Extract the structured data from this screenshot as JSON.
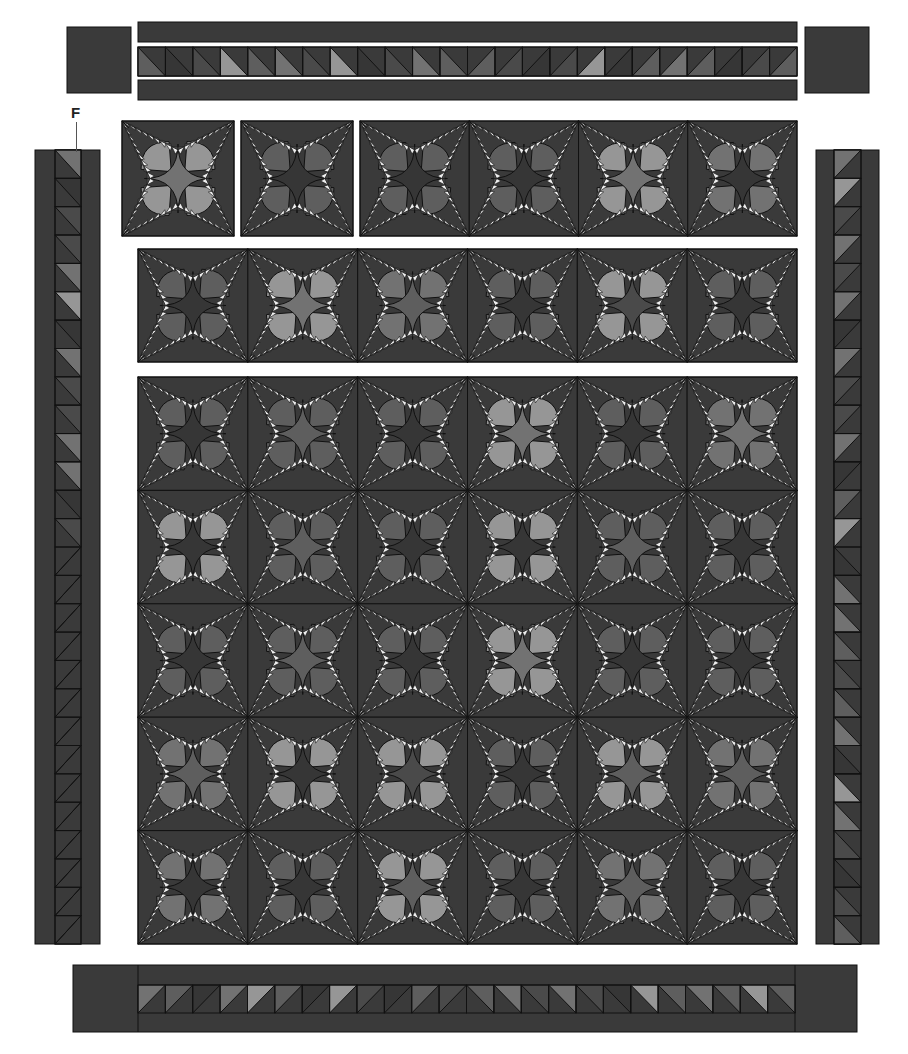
{
  "diagram": {
    "labels": [
      {
        "text": "F",
        "points_to": "left-border-hst-column"
      }
    ],
    "colors": {
      "background": "#ffffff",
      "outline": "#111111",
      "fabric_dark": "#3a3a3a",
      "fabric_darker": "#2f2f2f",
      "shades": {
        "dark": "#363636",
        "middark": "#4a4a4a",
        "mid": "#5e5e5e",
        "midlight": "#727272",
        "light": "#969696",
        "spike": "#eeeeee"
      }
    },
    "top_border": {
      "corner_squares": [
        {
          "x": 67,
          "y": 27,
          "w": 64,
          "h": 66
        },
        {
          "x": 805,
          "y": 27,
          "w": 64,
          "h": 66
        }
      ],
      "strips": [
        {
          "x": 138,
          "y": 22,
          "w": 659,
          "h": 20
        },
        {
          "x": 138,
          "y": 80,
          "w": 659,
          "h": 20
        }
      ],
      "hst_row": {
        "x": 138,
        "y": 47,
        "w": 659,
        "h": 29,
        "count": 24,
        "shades": [
          "mid",
          "dark",
          "middark",
          "light",
          "mid",
          "midlight",
          "middark",
          "light",
          "dark",
          "middark",
          "midlight",
          "mid",
          "mid",
          "middark",
          "dark",
          "middark",
          "light",
          "dark",
          "mid",
          "midlight",
          "mid",
          "dark",
          "middark",
          "mid"
        ]
      }
    },
    "left_border": {
      "x": 35,
      "y": 150,
      "w": 65,
      "h": 794,
      "hst_column": {
        "x": 55,
        "w": 26,
        "count": 28,
        "shades": [
          "midlight",
          "dark",
          "middark",
          "middark",
          "midlight",
          "light",
          "dark",
          "midlight",
          "middark",
          "middark",
          "midlight",
          "midlight",
          "dark",
          "middark",
          "light",
          "mid",
          "dark",
          "midlight",
          "mid",
          "middark",
          "midlight",
          "dark",
          "mid",
          "middark",
          "midlight",
          "mid",
          "light",
          "mid"
        ]
      }
    },
    "right_border": {
      "x": 816,
      "y": 150,
      "w": 63,
      "h": 794,
      "hst_column": {
        "x": 834,
        "w": 27,
        "count": 28,
        "shades": [
          "midlight",
          "light",
          "middark",
          "midlight",
          "middark",
          "midlight",
          "dark",
          "midlight",
          "middark",
          "middark",
          "midlight",
          "dark",
          "mid",
          "light",
          "dark",
          "midlight",
          "midlight",
          "mid",
          "middark",
          "mid",
          "midlight",
          "dark",
          "light",
          "midlight",
          "middark",
          "dark",
          "middark",
          "mid"
        ]
      }
    },
    "bottom_border": {
      "x": 73,
      "y": 965,
      "w": 784,
      "h": 67,
      "corner_splits": [
        138,
        795
      ],
      "hst_row": {
        "x": 138,
        "y": 985,
        "w": 657,
        "h": 28,
        "count": 24,
        "shades": [
          "midlight",
          "mid",
          "dark",
          "midlight",
          "light",
          "mid",
          "dark",
          "light",
          "middark",
          "dark",
          "mid",
          "middark",
          "mid",
          "midlight",
          "middark",
          "midlight",
          "middark",
          "dark",
          "light",
          "mid",
          "midlight",
          "mid",
          "light",
          "mid"
        ]
      }
    },
    "block_rows": [
      {
        "name": "row-1",
        "segments": [
          {
            "x": 122,
            "y": 121,
            "w": 112,
            "h": 115,
            "cols": 1,
            "rows": 1,
            "centers": [
              "midlight"
            ],
            "petals": [
              "light"
            ]
          },
          {
            "x": 241,
            "y": 121,
            "w": 112,
            "h": 115,
            "cols": 1,
            "rows": 1,
            "centers": [
              "dark"
            ],
            "petals": [
              "mid"
            ]
          },
          {
            "x": 360,
            "y": 121,
            "w": 437,
            "h": 115,
            "cols": 4,
            "rows": 1,
            "centers": [
              "dark",
              "dark",
              "midlight",
              "dark"
            ],
            "petals": [
              "mid",
              "mid",
              "light",
              "midlight"
            ]
          }
        ]
      },
      {
        "name": "row-2",
        "segments": [
          {
            "x": 138,
            "y": 249,
            "w": 659,
            "h": 113,
            "cols": 6,
            "rows": 1,
            "centers": [
              "dark",
              "midlight",
              "mid",
              "dark",
              "middark",
              "dark"
            ],
            "petals": [
              "mid",
              "light",
              "midlight",
              "mid",
              "light",
              "mid"
            ]
          }
        ]
      },
      {
        "name": "main-grid",
        "segments": [
          {
            "x": 138,
            "y": 377,
            "w": 659,
            "h": 567,
            "cols": 6,
            "rows": 5,
            "centers": [
              "dark",
              "mid",
              "dark",
              "midlight",
              "dark",
              "midlight",
              "dark",
              "mid",
              "dark",
              "dark",
              "mid",
              "dark",
              "dark",
              "mid",
              "dark",
              "midlight",
              "dark",
              "dark",
              "mid",
              "dark",
              "middark",
              "dark",
              "mid",
              "mid",
              "dark",
              "dark",
              "mid",
              "dark",
              "mid",
              "dark"
            ],
            "petals": [
              "mid",
              "mid",
              "mid",
              "light",
              "mid",
              "midlight",
              "light",
              "mid",
              "mid",
              "light",
              "mid",
              "mid",
              "mid",
              "mid",
              "mid",
              "light",
              "mid",
              "mid",
              "midlight",
              "light",
              "light",
              "mid",
              "light",
              "midlight",
              "midlight",
              "mid",
              "light",
              "mid",
              "midlight",
              "mid"
            ]
          }
        ]
      }
    ]
  }
}
